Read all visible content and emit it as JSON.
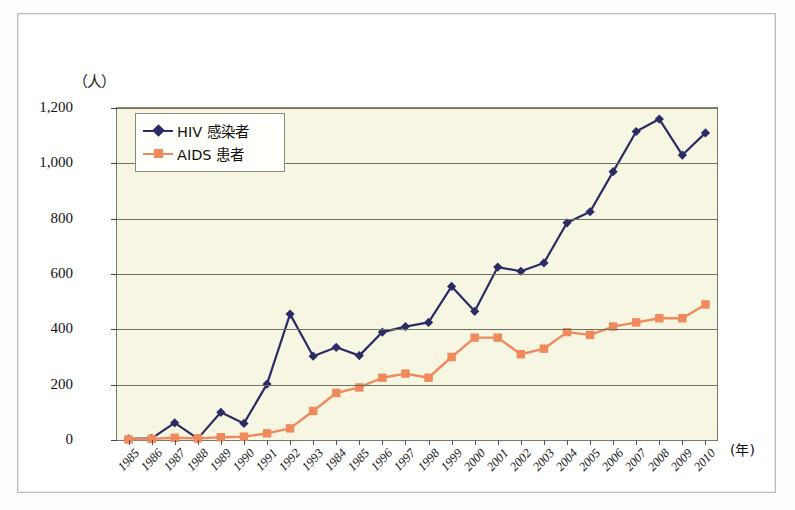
{
  "chart_data": {
    "type": "line",
    "title": "",
    "xlabel": "(年)",
    "ylabel": "（人）",
    "ylim": [
      0,
      1200
    ],
    "yticks": [
      "0",
      "200",
      "400",
      "600",
      "800",
      "1,000",
      "1,200"
    ],
    "grid": true,
    "legend_position": "top-left",
    "categories": [
      "1985",
      "1986",
      "1987",
      "1988",
      "1989",
      "1990",
      "1991",
      "1992",
      "1993",
      "1984",
      "1985",
      "1996",
      "1997",
      "1998",
      "1999",
      "2000",
      "2001",
      "2002",
      "2003",
      "2004",
      "2005",
      "2006",
      "2007",
      "2008",
      "2009",
      "2010"
    ],
    "series": [
      {
        "name": "HIV 感染者",
        "color": "#2b2b66",
        "marker": "diamond",
        "values": [
          4,
          6,
          62,
          5,
          100,
          60,
          202,
          455,
          303,
          335,
          305,
          390,
          410,
          425,
          555,
          465,
          625,
          610,
          640,
          785,
          825,
          970,
          1115,
          1160,
          1030,
          1110
        ]
      },
      {
        "name": "AIDS 患者",
        "color": "#f08a5d",
        "marker": "square",
        "values": [
          2,
          4,
          8,
          6,
          10,
          12,
          24,
          42,
          105,
          170,
          190,
          225,
          240,
          225,
          300,
          370,
          370,
          310,
          330,
          390,
          380,
          410,
          425,
          440,
          440,
          490
        ]
      }
    ]
  },
  "axis": {
    "y_unit_label": "（人）",
    "x_unit_label": "(年)"
  },
  "legend": {
    "items": [
      {
        "label": "HIV 感染者"
      },
      {
        "label": "AIDS 患者"
      }
    ]
  }
}
